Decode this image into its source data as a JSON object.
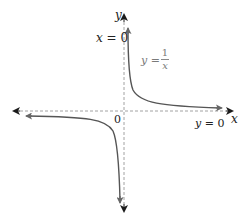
{
  "figure": {
    "axes": {
      "x_label": "x",
      "y_label": "y",
      "origin_label": "0"
    },
    "asymptotes": {
      "vertical_label_lhs": "x",
      "vertical_label_eq": "=",
      "vertical_label_rhs": "0",
      "horizontal_label_lhs": "y",
      "horizontal_label_eq": "=",
      "horizontal_label_rhs": "0"
    },
    "curve_label": {
      "lhs": "y",
      "eq": "=",
      "numerator": "1",
      "denominator": "x"
    },
    "colors": {
      "axis": "#1a1a1a",
      "asymptote_dash": "#8a8a8a",
      "curve": "#555555",
      "curve_label": "#7a7a7a"
    }
  }
}
